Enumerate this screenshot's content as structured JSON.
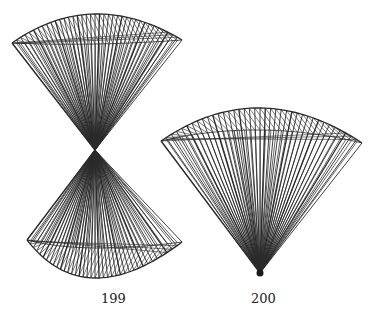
{
  "figures": [
    {
      "id": "fig199",
      "label": "199",
      "type": "hourglass-ruled-surface",
      "label_pos": {
        "x": 110,
        "y": 300
      },
      "center": {
        "x": 95,
        "y": 150
      },
      "upper": {
        "left": [
          12,
          43
        ],
        "right": [
          182,
          40
        ],
        "peak": [
          95,
          14
        ],
        "inner_arc_depth": 30
      },
      "lower": {
        "left": [
          27,
          240
        ],
        "right": [
          182,
          242
        ],
        "trough": [
          95,
          278
        ],
        "inner_arc_depth": 30
      },
      "line_count": 38
    },
    {
      "id": "fig200",
      "label": "200",
      "type": "fan-ruled-surface",
      "label_pos": {
        "x": 260,
        "y": 300
      },
      "apex": {
        "x": 260,
        "y": 275
      },
      "top": {
        "left": [
          161,
          141
        ],
        "right": [
          362,
          143
        ],
        "peak": [
          260,
          108
        ],
        "inner_arc_depth": 22
      },
      "line_count": 38
    }
  ],
  "style": {
    "stroke": "#2a2a2a",
    "background": "#ffffff"
  }
}
